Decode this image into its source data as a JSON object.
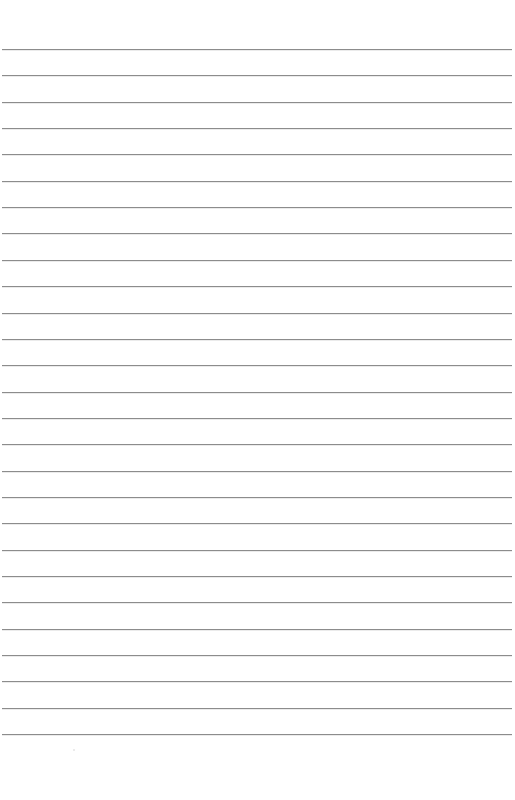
{
  "page": {
    "type": "blank lined notebook paper",
    "background_color": "#ffffff",
    "line_color": "#8c8c8c",
    "line_count": 27,
    "first_line_y": 49,
    "line_spacing_px": 26.35,
    "line_left_x": 2,
    "line_right_x": 512,
    "text_content": []
  }
}
